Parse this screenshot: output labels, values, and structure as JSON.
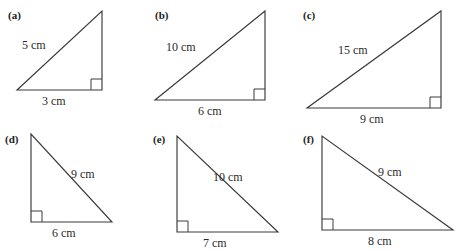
{
  "sheet": {
    "title": "Right-angled triangle exercise figures",
    "background_color": "#ffffff",
    "line_color": "#3a3a3a",
    "text_color": "#2b2b2b",
    "columns": 3,
    "rows": 2
  },
  "figures": [
    {
      "tag": "(a)",
      "orientation": "right-angle-bottom-right",
      "hypotenuse_label": "5 cm",
      "base_label": "3 cm",
      "hypotenuse_value": 5,
      "base_value": 3,
      "unit": "cm",
      "right_angle_corner": "bottom-right"
    },
    {
      "tag": "(b)",
      "orientation": "right-angle-bottom-right",
      "hypotenuse_label": "10 cm",
      "base_label": "6 cm",
      "hypotenuse_value": 10,
      "base_value": 6,
      "unit": "cm",
      "right_angle_corner": "bottom-right"
    },
    {
      "tag": "(c)",
      "orientation": "right-angle-bottom-right",
      "hypotenuse_label": "15 cm",
      "base_label": "9 cm",
      "hypotenuse_value": 15,
      "base_value": 9,
      "unit": "cm",
      "right_angle_corner": "bottom-right"
    },
    {
      "tag": "(d)",
      "orientation": "right-angle-bottom-left",
      "hypotenuse_label": "9 cm",
      "base_label": "6 cm",
      "hypotenuse_value": 9,
      "base_value": 6,
      "unit": "cm",
      "right_angle_corner": "bottom-left"
    },
    {
      "tag": "(e)",
      "orientation": "right-angle-bottom-left",
      "hypotenuse_label": "10 cm",
      "base_label": "7 cm",
      "hypotenuse_value": 10,
      "base_value": 7,
      "unit": "cm",
      "right_angle_corner": "bottom-left"
    },
    {
      "tag": "(f)",
      "orientation": "right-angle-bottom-left",
      "hypotenuse_label": "9 cm",
      "base_label": "8 cm",
      "hypotenuse_value": 9,
      "base_value": 8,
      "unit": "cm",
      "right_angle_corner": "bottom-left"
    }
  ]
}
